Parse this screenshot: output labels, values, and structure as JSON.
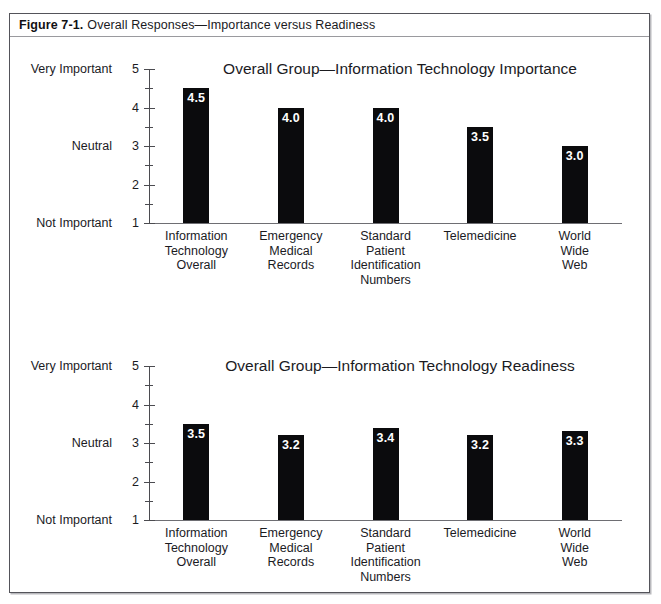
{
  "figure": {
    "label": "Figure 7-1.",
    "caption": "Overall Responses—Importance versus Readiness"
  },
  "axis": {
    "scale_numbers": [
      "5",
      "4",
      "3",
      "2",
      "1"
    ],
    "anchor_top": "Very Important",
    "anchor_mid": "Neutral",
    "anchor_bottom": "Not Important"
  },
  "categories": [
    "Information\nTechnology\nOverall",
    "Emergency\nMedical\nRecords",
    "Standard\nPatient\nIdentification\nNumbers",
    "Telemedicine",
    "World\nWide\nWeb"
  ],
  "charts": [
    {
      "title": "Overall Group—Information Technology Importance",
      "labels": [
        "4.5",
        "4.0",
        "4.0",
        "3.5",
        "3.0"
      ]
    },
    {
      "title": "Overall Group—Information Technology Readiness",
      "labels": [
        "3.5",
        "3.2",
        "3.4",
        "3.2",
        "3.3"
      ]
    }
  ],
  "colors": {
    "bar": "#0b0b0d",
    "frame": "#54545a",
    "text": "#1b1b1f"
  },
  "chart_data": [
    {
      "type": "bar",
      "title": "Overall Group—Information Technology Importance",
      "categories": [
        "Information Technology Overall",
        "Emergency Medical Records",
        "Standard Patient Identification Numbers",
        "Telemedicine",
        "World Wide Web"
      ],
      "values": [
        4.5,
        4.0,
        4.0,
        3.5,
        3.0
      ],
      "xlabel": "",
      "ylabel": "",
      "ylim": [
        1,
        5
      ],
      "ytick_values": [
        1,
        2,
        3,
        4,
        5
      ],
      "ytick_labels": [
        "1",
        "2",
        "3",
        "4",
        "5"
      ],
      "yminor_ticks": [
        1.5,
        2.5,
        3.5,
        4.5
      ],
      "yaxis_anchors": {
        "5": "Very Important",
        "3": "Neutral",
        "1": "Not Important"
      },
      "bar_color": "#0b0b0d",
      "data_labels": [
        "4.5",
        "4.0",
        "4.0",
        "3.5",
        "3.0"
      ],
      "grid": false,
      "legend": false
    },
    {
      "type": "bar",
      "title": "Overall Group—Information Technology Readiness",
      "categories": [
        "Information Technology Overall",
        "Emergency Medical Records",
        "Standard Patient Identification Numbers",
        "Telemedicine",
        "World Wide Web"
      ],
      "values": [
        3.5,
        3.2,
        3.4,
        3.2,
        3.3
      ],
      "xlabel": "",
      "ylabel": "",
      "ylim": [
        1,
        5
      ],
      "ytick_values": [
        1,
        2,
        3,
        4,
        5
      ],
      "ytick_labels": [
        "1",
        "2",
        "3",
        "4",
        "5"
      ],
      "yminor_ticks": [
        1.5,
        2.5,
        3.5,
        4.5
      ],
      "yaxis_anchors": {
        "5": "Very Important",
        "3": "Neutral",
        "1": "Not Important"
      },
      "bar_color": "#0b0b0d",
      "data_labels": [
        "3.5",
        "3.2",
        "3.4",
        "3.2",
        "3.3"
      ],
      "grid": false,
      "legend": false
    }
  ]
}
